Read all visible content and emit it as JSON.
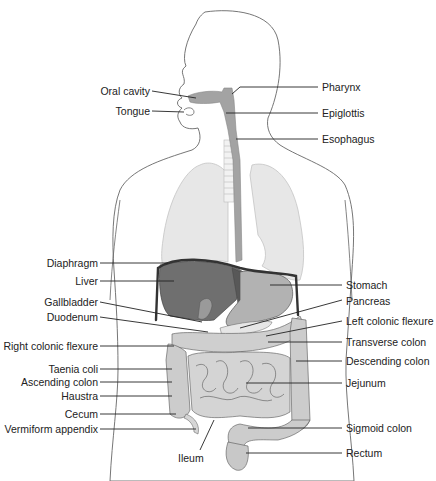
{
  "diagram": {
    "colors": {
      "skin_outline": "#555555",
      "lungs": "#e6e6e6",
      "liver": "#6e6e6e",
      "organ_mid": "#a8a8a8",
      "intestine": "#c8c8c8",
      "tract": "#9a9a9a",
      "diaphragm": "#333333",
      "label_text": "#222222",
      "leader_line": "#222222"
    },
    "labels_left": [
      {
        "text": "Oral cavity",
        "x": 165,
        "y": 90
      },
      {
        "text": "Tongue",
        "x": 165,
        "y": 110
      },
      {
        "text": "Diaphragm",
        "x": 90,
        "y": 263
      },
      {
        "text": "Liver",
        "x": 90,
        "y": 281
      },
      {
        "text": "Gallbladder",
        "x": 90,
        "y": 302
      },
      {
        "text": "Duodenum",
        "x": 90,
        "y": 317
      },
      {
        "text": "Right colonic flexure",
        "x": 90,
        "y": 346
      },
      {
        "text": "Taenia coli",
        "x": 90,
        "y": 369
      },
      {
        "text": "Ascending colon",
        "x": 90,
        "y": 382
      },
      {
        "text": "Haustra",
        "x": 90,
        "y": 396
      },
      {
        "text": "Cecum",
        "x": 90,
        "y": 414
      },
      {
        "text": "Vermiform appendix",
        "x": 90,
        "y": 429
      }
    ],
    "labels_right": [
      {
        "text": "Pharynx",
        "x": 322,
        "y": 87
      },
      {
        "text": "Epiglottis",
        "x": 322,
        "y": 113
      },
      {
        "text": "Esophagus",
        "x": 322,
        "y": 139
      },
      {
        "text": "Stomach",
        "x": 346,
        "y": 285
      },
      {
        "text": "Pancreas",
        "x": 346,
        "y": 301
      },
      {
        "text": "Left colonic flexure",
        "x": 346,
        "y": 321
      },
      {
        "text": "Transverse colon",
        "x": 346,
        "y": 342
      },
      {
        "text": "Descending colon",
        "x": 346,
        "y": 361
      },
      {
        "text": "Jejunum",
        "x": 346,
        "y": 383
      },
      {
        "text": "Sigmoid colon",
        "x": 346,
        "y": 428
      },
      {
        "text": "Rectum",
        "x": 346,
        "y": 453
      }
    ],
    "labels_bottom": [
      {
        "text": "Ileum",
        "x": 180,
        "y": 455
      }
    ]
  }
}
